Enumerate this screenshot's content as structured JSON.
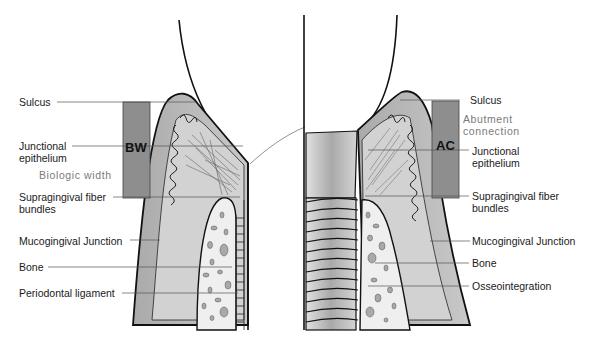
{
  "diagram": {
    "left_panel": {
      "topic": "natural tooth",
      "labels": [
        {
          "id": "sulcus",
          "text": "Sulcus"
        },
        {
          "id": "junctional-epithelium",
          "text": "Junctional epithelium"
        },
        {
          "id": "supragingival-fiber-bundles",
          "text": "Supragingival fiber bundles"
        },
        {
          "id": "mucogingival-junction",
          "text": "Mucogingival Junction"
        },
        {
          "id": "bone",
          "text": "Bone"
        },
        {
          "id": "periodontal-ligament",
          "text": "Periodontal ligament"
        }
      ],
      "bar": {
        "abbr": "BW",
        "caption": "Biologic width"
      }
    },
    "right_panel": {
      "topic": "dental implant",
      "labels": [
        {
          "id": "sulcus",
          "text": "Sulcus"
        },
        {
          "id": "junctional-epithelium",
          "text": "Junctional epithelium"
        },
        {
          "id": "supragingival-fiber-bundles",
          "text": "Supragingival fiber bundles"
        },
        {
          "id": "mucogingival-junction",
          "text": "Mucogingival Junction"
        },
        {
          "id": "bone",
          "text": "Bone"
        },
        {
          "id": "osseointegration",
          "text": "Osseointegration"
        }
      ],
      "bar": {
        "abbr": "AC",
        "caption": "Abutment connection"
      }
    },
    "colors": {
      "gingiva": "#b8b8b8",
      "gingiva_inner": "#cfcfcf",
      "bar": "#8e8e8e",
      "bone": "#eeeeee",
      "bone_spots": "#a8a8a8",
      "outline": "#111111",
      "leader": "#555555",
      "implant": "#c4c4c4",
      "caption": "#7a7a7a"
    }
  }
}
